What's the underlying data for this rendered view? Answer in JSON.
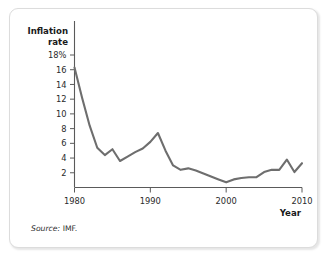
{
  "figure": {
    "source_note_label": "Source:",
    "source_note_value": "IMF."
  },
  "chart_data": {
    "type": "line",
    "title": "",
    "ylabel": "Inflation rate",
    "ylabel_line1": "Inflation",
    "ylabel_line2": "rate",
    "xlabel": "Year",
    "yticks": [
      2,
      4,
      6,
      8,
      10,
      12,
      14,
      16,
      18
    ],
    "ytick_labels": [
      "2",
      "4",
      "6",
      "8",
      "10",
      "12",
      "14",
      "16",
      "18%"
    ],
    "xticks": [
      1980,
      1990,
      2000,
      2010
    ],
    "xtick_labels": [
      "1980",
      "1990",
      "2000",
      "2010"
    ],
    "xlim": [
      1980,
      2010
    ],
    "ylim": [
      0,
      18
    ],
    "grid": false,
    "legend": null,
    "line_color": "#6e6e6e",
    "x": [
      1980,
      1981,
      1982,
      1983,
      1984,
      1985,
      1986,
      1987,
      1988,
      1989,
      1990,
      1991,
      1992,
      1993,
      1994,
      1995,
      1996,
      1997,
      1998,
      1999,
      2000,
      2001,
      2002,
      2003,
      2004,
      2005,
      2006,
      2007,
      2008,
      2009,
      2010
    ],
    "values": [
      16.3,
      12.2,
      8.4,
      5.4,
      4.4,
      5.2,
      3.6,
      4.2,
      4.8,
      5.3,
      6.2,
      7.4,
      5.0,
      3.0,
      2.4,
      2.6,
      2.3,
      1.9,
      1.5,
      1.1,
      0.7,
      1.1,
      1.3,
      1.4,
      1.4,
      2.1,
      2.4,
      2.4,
      3.8,
      2.1,
      3.3
    ]
  }
}
